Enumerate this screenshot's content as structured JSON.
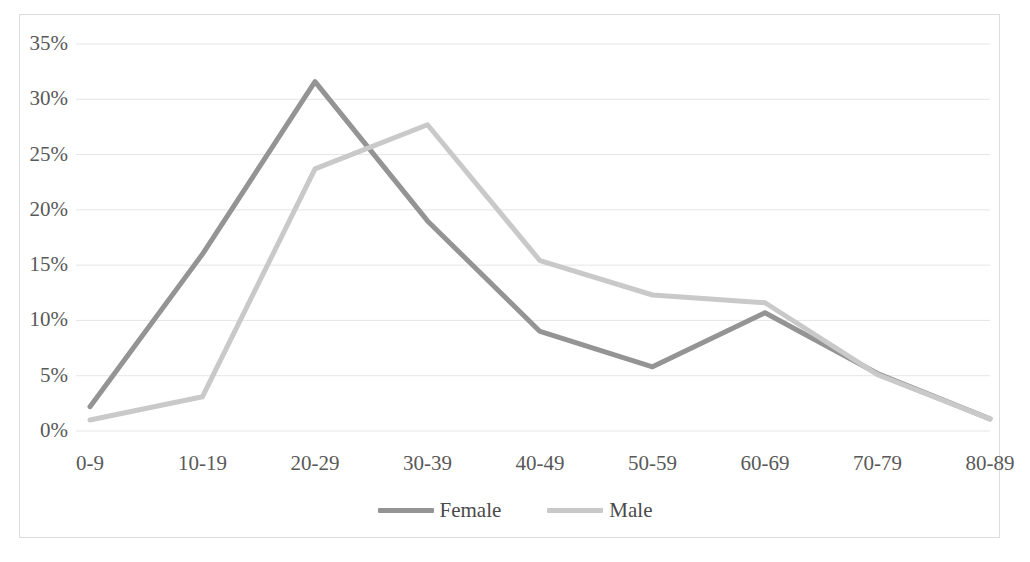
{
  "chart_data": {
    "type": "line",
    "title": "",
    "subtitle": "",
    "xlabel": "",
    "ylabel": "",
    "categories": [
      "0-9",
      "10-19",
      "20-29",
      "30-39",
      "40-49",
      "50-59",
      "60-69",
      "70-79",
      "80-89"
    ],
    "series": [
      {
        "name": "Female",
        "color": "#949494",
        "values": [
          2.2,
          16.0,
          31.6,
          19.0,
          9.0,
          5.8,
          10.7,
          5.2,
          1.1
        ]
      },
      {
        "name": "Male",
        "color": "#c9c9c9",
        "values": [
          1.0,
          3.1,
          23.7,
          27.7,
          15.4,
          12.3,
          11.6,
          5.1,
          1.1
        ]
      }
    ],
    "ylim": [
      0,
      35
    ],
    "ytick_values": [
      0,
      5,
      10,
      15,
      20,
      25,
      30,
      35
    ],
    "ytick_labels": [
      "0%",
      "5%",
      "10%",
      "15%",
      "20%",
      "25%",
      "30%",
      "35%"
    ],
    "grid": true,
    "grid_color": "#e6e6e6",
    "legend_position": "bottom",
    "border_color": "#dcdcdc",
    "background": "#ffffff",
    "axis_label_color": "#595959"
  },
  "legend": {
    "entries": [
      {
        "label": "Female"
      },
      {
        "label": "Male"
      }
    ]
  },
  "caption": {
    "text": ""
  }
}
